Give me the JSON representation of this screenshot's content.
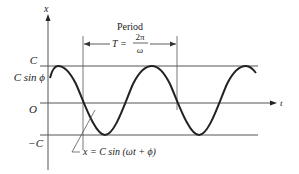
{
  "diagram": {
    "type": "sinusoid",
    "axes": {
      "vertical_label": "x",
      "horizontal_label": "t",
      "origin_label": "O"
    },
    "levels": {
      "upper": "C",
      "phase_value": "C sin ϕ",
      "lower": "−C"
    },
    "period": {
      "title": "Period",
      "T_lhs": "T =",
      "numerator": "2π",
      "denominator": "ω"
    },
    "equation": "x = C sin (ωt + ϕ)",
    "colors": {
      "curve": "#222222",
      "lines": "#555555",
      "background": "#ffffff"
    }
  }
}
